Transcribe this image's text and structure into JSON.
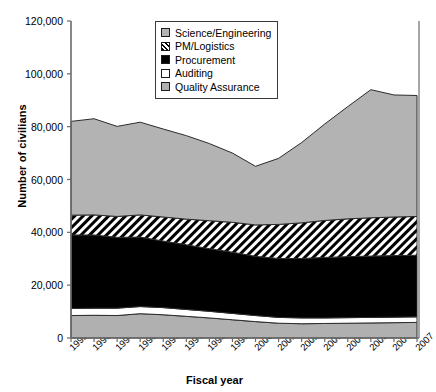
{
  "chart_data": {
    "type": "area",
    "stacked": true,
    "title": "",
    "xlabel": "Fiscal year",
    "ylabel": "Number of civilians",
    "categories": [
      1992,
      1993,
      1994,
      1995,
      1996,
      1997,
      1998,
      1999,
      2000,
      2001,
      2002,
      2003,
      2004,
      2005,
      2006,
      2007
    ],
    "x_tick_labels": [
      "1992",
      "1993",
      "1994",
      "1995",
      "1996",
      "1997",
      "1998",
      "1999",
      "2000",
      "2001",
      "2002",
      "2003",
      "2004",
      "2005",
      "2006",
      "2007"
    ],
    "y_tick_labels": [
      "0",
      "20,000",
      "40,000",
      "60,000",
      "80,000",
      "100,000",
      "120,000"
    ],
    "y_ticks": [
      0,
      20000,
      40000,
      60000,
      80000,
      100000,
      120000
    ],
    "ylim": [
      0,
      120000
    ],
    "grid": false,
    "legend_position": "top-center",
    "series": [
      {
        "name": "Quality Assurance",
        "color": "#b0b0b0",
        "pattern": "solid",
        "values": [
          8500,
          8600,
          8500,
          9200,
          8800,
          8200,
          7600,
          6900,
          6200,
          5600,
          5400,
          5500,
          5600,
          5700,
          5800,
          5900
        ]
      },
      {
        "name": "Auditing",
        "color": "#ffffff",
        "pattern": "solid",
        "values": [
          2700,
          2700,
          2800,
          2700,
          2700,
          2600,
          2500,
          2400,
          2300,
          2200,
          2200,
          2100,
          2100,
          2100,
          2100,
          2100
        ]
      },
      {
        "name": "Procurement",
        "color": "#000000",
        "pattern": "solid",
        "values": [
          27800,
          27700,
          26800,
          26300,
          25200,
          24500,
          23700,
          23200,
          22400,
          22300,
          22500,
          22900,
          23100,
          23200,
          23300,
          23300
        ]
      },
      {
        "name": "PM/Logistics",
        "color": "#ffffff",
        "pattern": "diagonal-hatch",
        "values": [
          7500,
          7600,
          7900,
          8400,
          9100,
          9700,
          10600,
          11300,
          11900,
          12900,
          13500,
          14000,
          14300,
          14500,
          14600,
          14700
        ]
      },
      {
        "name": "Science/Engineering",
        "color": "#b3b3b3",
        "pattern": "solid",
        "values": [
          35500,
          36400,
          34100,
          35100,
          33300,
          31600,
          29200,
          26200,
          22200,
          25000,
          30400,
          36500,
          42500,
          48500,
          46200,
          45800
        ]
      }
    ],
    "totals": [
      82000,
      83000,
      80100,
      81700,
      79100,
      76600,
      73600,
      70000,
      65000,
      68000,
      74000,
      81000,
      87600,
      94000,
      92000,
      91800
    ]
  },
  "legend": {
    "items": [
      {
        "label": "Science/Engineering",
        "swatch": "sw-sci",
        "name": "legend-swatch-science-engineering"
      },
      {
        "label": "PM/Logistics",
        "swatch": "sw-pm",
        "name": "legend-swatch-pm-logistics"
      },
      {
        "label": "Procurement",
        "swatch": "sw-proc",
        "name": "legend-swatch-procurement"
      },
      {
        "label": "Auditing",
        "swatch": "sw-aud",
        "name": "legend-swatch-auditing"
      },
      {
        "label": "Quality Assurance",
        "swatch": "sw-qa",
        "name": "legend-swatch-quality-assurance"
      }
    ]
  }
}
